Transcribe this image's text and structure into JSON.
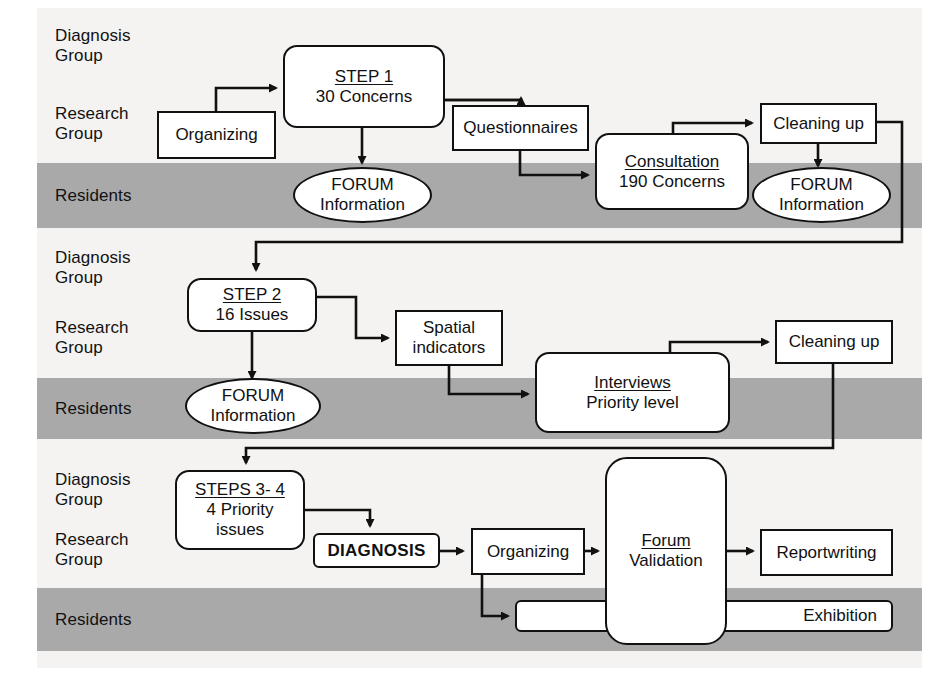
{
  "diagram": {
    "colors": {
      "band_gray": "#a9a9a9",
      "page_bg": "#f4f3f1",
      "stroke": "#111111",
      "node_fill": "#ffffff"
    },
    "lanes": [
      {
        "id": "lane-diagnosis-1",
        "label": "Diagnosis\nGroup",
        "type": "white"
      },
      {
        "id": "lane-research-1",
        "label": "Research\nGroup",
        "type": "white"
      },
      {
        "id": "lane-residents-1",
        "label": "Residents",
        "type": "gray"
      },
      {
        "id": "lane-diagnosis-2",
        "label": "Diagnosis\nGroup",
        "type": "white"
      },
      {
        "id": "lane-research-2",
        "label": "Research\nGroup",
        "type": "white"
      },
      {
        "id": "lane-residents-2",
        "label": "Residents",
        "type": "gray"
      },
      {
        "id": "lane-diagnosis-3",
        "label": "Diagnosis\nGroup",
        "type": "white"
      },
      {
        "id": "lane-research-3",
        "label": "Research\nGroup",
        "type": "white"
      },
      {
        "id": "lane-residents-3",
        "label": "Residents",
        "type": "gray"
      }
    ],
    "nodes": {
      "organizing_1": {
        "line1": "Organizing",
        "line2": ""
      },
      "step_1": {
        "line1": "STEP 1",
        "line2": "30 Concerns"
      },
      "questionnaires": {
        "line1": "Questionnaires",
        "line2": ""
      },
      "consultation": {
        "line1": "Consultation",
        "line2": "190 Concerns"
      },
      "cleaning_up_1": {
        "line1": "Cleaning up",
        "line2": ""
      },
      "forum_1": {
        "line1": "FORUM",
        "line2": "Information"
      },
      "forum_2": {
        "line1": "FORUM",
        "line2": "Information"
      },
      "step_2": {
        "line1": "STEP 2",
        "line2": "16 Issues"
      },
      "spatial_indicators": {
        "line1": "Spatial",
        "line2": "indicators"
      },
      "interviews": {
        "line1": "Interviews",
        "line2": "Priority level"
      },
      "cleaning_up_2": {
        "line1": "Cleaning up",
        "line2": ""
      },
      "forum_3": {
        "line1": "FORUM",
        "line2": "Information"
      },
      "steps_3_4": {
        "line1": "STEPS 3- 4",
        "line2": "4 Priority",
        "line3": "issues"
      },
      "diagnosis": {
        "line1": "DIAGNOSIS",
        "line2": ""
      },
      "organizing_2": {
        "line1": "Organizing",
        "line2": ""
      },
      "forum_validation": {
        "line1": "Forum",
        "line2": "Validation"
      },
      "reportwriting": {
        "line1": "Reportwriting",
        "line2": ""
      },
      "exhibition": {
        "line1": "Exhibition",
        "line2": ""
      }
    }
  }
}
